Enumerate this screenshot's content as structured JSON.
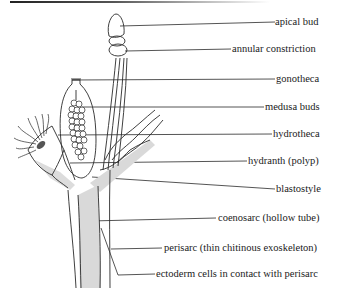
{
  "diagram": {
    "labels": [
      {
        "id": "apical-bud",
        "text": "apical bud",
        "x": 275,
        "y": 16
      },
      {
        "id": "annular-constriction",
        "text": "annular constriction",
        "x": 232,
        "y": 42
      },
      {
        "id": "gonotheca",
        "text": "gonotheca",
        "x": 276,
        "y": 71
      },
      {
        "id": "medusa-buds",
        "text": "medusa buds",
        "x": 265,
        "y": 99
      },
      {
        "id": "hydrotheca",
        "text": "hydrotheca",
        "x": 273,
        "y": 126
      },
      {
        "id": "hydranth",
        "text": "hydranth (polyp)",
        "x": 248,
        "y": 153
      },
      {
        "id": "blastostyle",
        "text": "blastostyle",
        "x": 276,
        "y": 181
      },
      {
        "id": "coenosarc",
        "text": "coenosarc (hollow tube)",
        "x": 218,
        "y": 210
      },
      {
        "id": "perisarc",
        "text": "perisarc (thin chitinous exoskeleton)",
        "x": 164,
        "y": 239
      },
      {
        "id": "ectoderm",
        "text": "ectoderm cells in contact with perisarc",
        "x": 156,
        "y": 264
      }
    ],
    "colors": {
      "line": "#2a2a2a",
      "fill": "#d9d9d9",
      "text": "#1a1a1a"
    }
  }
}
